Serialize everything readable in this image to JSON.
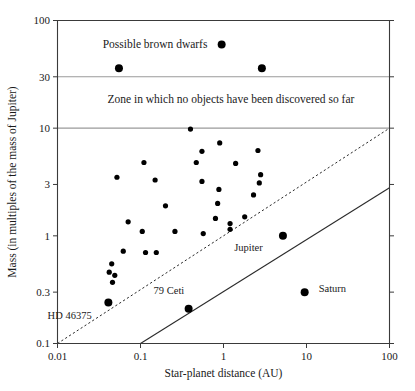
{
  "chart_data": {
    "type": "scatter",
    "title": "",
    "xlabel": "Star-planet distance (AU)",
    "ylabel": "Mass (in multiples of the mass of Jupiter)",
    "xscale": "log",
    "yscale": "log",
    "xlim": [
      0.01,
      100
    ],
    "ylim": [
      0.1,
      100
    ],
    "grid": false,
    "legend": "none",
    "xticks": [
      "0.01",
      "0.1",
      "1",
      "10",
      "100"
    ],
    "xtick_values": [
      0.01,
      0.1,
      1,
      100
    ],
    "yticks": [
      "0.1",
      "0.3",
      "1",
      "3",
      "10",
      "30",
      "100"
    ],
    "ytick_values": [
      0.1,
      0.3,
      1,
      3,
      10,
      30,
      100
    ],
    "annotations": [
      {
        "text": "Possible brown dwarfs",
        "x": 0.035,
        "y": 55
      },
      {
        "text": "Zone in which no objects have been discovered so far",
        "x": 0.04,
        "y": 17
      },
      {
        "text": "Jupiter",
        "x": 2.0,
        "y": 0.72
      },
      {
        "text": "Saturn",
        "x": 14.0,
        "y": 0.3
      },
      {
        "text": "79 Ceti",
        "x": 0.22,
        "y": 0.29
      },
      {
        "text": "HD 46375",
        "x": 0.014,
        "y": 0.17
      }
    ],
    "zone_boundaries": [
      {
        "label": "brown-dwarf-lower-bound",
        "y": 30
      },
      {
        "label": "no-objects-lower-bound",
        "y": 10
      }
    ],
    "reference_lines": [
      {
        "name": "dashed-detection-limit",
        "style": "dashed",
        "points": [
          [
            0.01,
            0.1
          ],
          [
            100,
            10
          ]
        ]
      },
      {
        "name": "solid-detection-limit",
        "style": "solid",
        "points": [
          [
            0.1,
            0.1
          ],
          [
            100,
            2.8
          ]
        ]
      }
    ],
    "series": [
      {
        "name": "Possible brown dwarfs",
        "marker_size": "large",
        "points": [
          {
            "x": 0.055,
            "y": 36
          },
          {
            "x": 0.95,
            "y": 60
          },
          {
            "x": 2.9,
            "y": 36
          }
        ]
      },
      {
        "name": "Extrasolar planets",
        "marker_size": "small",
        "points": [
          {
            "x": 0.4,
            "y": 9.8
          },
          {
            "x": 0.9,
            "y": 7.3
          },
          {
            "x": 2.6,
            "y": 6.2
          },
          {
            "x": 0.55,
            "y": 6.1
          },
          {
            "x": 0.47,
            "y": 4.8
          },
          {
            "x": 0.11,
            "y": 4.8
          },
          {
            "x": 1.4,
            "y": 4.7
          },
          {
            "x": 2.8,
            "y": 3.7
          },
          {
            "x": 0.052,
            "y": 3.5
          },
          {
            "x": 0.15,
            "y": 3.3
          },
          {
            "x": 0.55,
            "y": 3.2
          },
          {
            "x": 2.7,
            "y": 3.1
          },
          {
            "x": 0.88,
            "y": 2.7
          },
          {
            "x": 2.3,
            "y": 2.4
          },
          {
            "x": 0.85,
            "y": 2.0
          },
          {
            "x": 0.2,
            "y": 1.9
          },
          {
            "x": 1.8,
            "y": 1.5
          },
          {
            "x": 0.8,
            "y": 1.45
          },
          {
            "x": 1.2,
            "y": 1.3
          },
          {
            "x": 1.2,
            "y": 1.15
          },
          {
            "x": 0.071,
            "y": 1.35
          },
          {
            "x": 0.105,
            "y": 1.1
          },
          {
            "x": 0.26,
            "y": 1.1
          },
          {
            "x": 0.57,
            "y": 1.05
          },
          {
            "x": 0.062,
            "y": 0.72
          },
          {
            "x": 0.115,
            "y": 0.7
          },
          {
            "x": 0.155,
            "y": 0.7
          },
          {
            "x": 0.045,
            "y": 0.55
          },
          {
            "x": 0.042,
            "y": 0.46
          },
          {
            "x": 0.049,
            "y": 0.43
          },
          {
            "x": 0.046,
            "y": 0.37
          }
        ]
      },
      {
        "name": "Named objects",
        "marker_size": "large",
        "points": [
          {
            "x": 0.041,
            "y": 0.24,
            "label": "HD 46375"
          },
          {
            "x": 0.38,
            "y": 0.21,
            "label": "79 Ceti"
          },
          {
            "x": 5.2,
            "y": 1.0,
            "label": "Jupiter"
          },
          {
            "x": 9.5,
            "y": 0.3,
            "label": "Saturn"
          }
        ]
      }
    ]
  },
  "colors": {
    "marker": "#000000",
    "axis": "#3a3a3a",
    "zone_line": "#9a9a9a",
    "text": "#1a1a1a",
    "background": "#ffffff"
  }
}
